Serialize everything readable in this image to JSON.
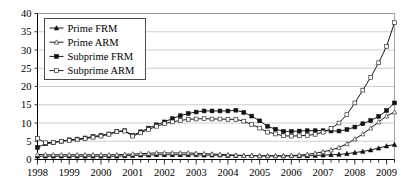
{
  "chart_data": {
    "type": "line",
    "title": "",
    "xlabel": "",
    "ylabel": "",
    "ylim": [
      0,
      40
    ],
    "ytick_step": 5,
    "yticks": [
      0,
      5,
      10,
      15,
      20,
      25,
      30,
      35,
      40
    ],
    "grid": true,
    "legend_position": "top-left",
    "x_axis_type": "quarterly",
    "xlim": [
      "1998 Q1",
      "2009 Q2"
    ],
    "categories": [
      "1998Q1",
      "1998Q2",
      "1998Q3",
      "1998Q4",
      "1999Q1",
      "1999Q2",
      "1999Q3",
      "1999Q4",
      "2000Q1",
      "2000Q2",
      "2000Q3",
      "2000Q4",
      "2001Q1",
      "2001Q2",
      "2001Q3",
      "2001Q4",
      "2002Q1",
      "2002Q2",
      "2002Q3",
      "2002Q4",
      "2003Q1",
      "2003Q2",
      "2003Q3",
      "2003Q4",
      "2004Q1",
      "2004Q2",
      "2004Q3",
      "2004Q4",
      "2005Q1",
      "2005Q2",
      "2005Q3",
      "2005Q4",
      "2006Q1",
      "2006Q2",
      "2006Q3",
      "2006Q4",
      "2007Q1",
      "2007Q2",
      "2007Q3",
      "2007Q4",
      "2008Q1",
      "2008Q2",
      "2008Q3",
      "2008Q4",
      "2009Q1",
      "2009Q2"
    ],
    "xtick_labels": [
      "1998",
      "1999",
      "2000",
      "2001",
      "2002",
      "2003",
      "2004",
      "2005",
      "2006",
      "2007",
      "2008",
      "2009"
    ],
    "series": [
      {
        "name": "Prime FRM",
        "marker": "filled-triangle",
        "values": [
          0.9,
          0.9,
          0.9,
          0.9,
          0.9,
          0.9,
          0.9,
          0.9,
          0.9,
          0.9,
          0.9,
          1.0,
          1.1,
          1.2,
          1.2,
          1.3,
          1.3,
          1.3,
          1.3,
          1.3,
          1.3,
          1.2,
          1.2,
          1.2,
          1.1,
          1.1,
          1.1,
          1.1,
          1.0,
          1.0,
          1.0,
          1.0,
          1.0,
          1.0,
          1.0,
          1.1,
          1.2,
          1.3,
          1.4,
          1.6,
          1.9,
          2.2,
          2.6,
          3.1,
          3.7,
          4.1
        ]
      },
      {
        "name": "Prime ARM",
        "marker": "open-triangle",
        "values": [
          1.4,
          1.3,
          1.3,
          1.3,
          1.3,
          1.3,
          1.3,
          1.3,
          1.3,
          1.3,
          1.3,
          1.4,
          1.5,
          1.6,
          1.7,
          1.8,
          1.8,
          1.8,
          1.8,
          1.8,
          1.7,
          1.6,
          1.5,
          1.4,
          1.3,
          1.2,
          1.1,
          1.1,
          1.0,
          1.0,
          1.0,
          1.0,
          1.1,
          1.2,
          1.4,
          1.7,
          2.1,
          2.6,
          3.3,
          4.3,
          5.6,
          7.0,
          8.6,
          10.3,
          11.9,
          13.0
        ]
      },
      {
        "name": "Subprime FRM",
        "marker": "filled-square",
        "values": [
          3.3,
          4.3,
          4.6,
          5.0,
          5.4,
          5.6,
          5.9,
          6.3,
          6.6,
          7.0,
          7.7,
          7.9,
          6.6,
          7.6,
          8.6,
          9.5,
          10.3,
          11.2,
          12.0,
          12.6,
          13.0,
          13.3,
          13.3,
          13.3,
          13.3,
          13.5,
          12.9,
          11.9,
          10.6,
          9.1,
          8.3,
          7.7,
          7.7,
          7.8,
          7.9,
          7.9,
          7.9,
          7.8,
          7.8,
          8.2,
          8.9,
          9.8,
          10.7,
          11.8,
          13.4,
          15.5
        ]
      },
      {
        "name": "Subprime ARM",
        "marker": "open-square",
        "values": [
          5.8,
          4.6,
          4.7,
          5.0,
          5.2,
          5.4,
          5.7,
          6.1,
          6.4,
          6.9,
          7.6,
          7.8,
          6.4,
          7.3,
          8.2,
          9.1,
          9.8,
          10.3,
          10.7,
          11.0,
          11.1,
          11.2,
          11.1,
          11.1,
          11.0,
          11.0,
          10.5,
          9.6,
          8.6,
          7.5,
          7.0,
          6.5,
          6.4,
          6.5,
          6.6,
          6.9,
          7.5,
          8.5,
          10.0,
          12.3,
          15.5,
          19.0,
          22.5,
          26.5,
          31.0,
          37.5
        ]
      }
    ]
  },
  "legend": {
    "items": [
      {
        "label": "Prime FRM"
      },
      {
        "label": "Prime ARM"
      },
      {
        "label": "Subprime FRM"
      },
      {
        "label": "Subprime ARM"
      }
    ]
  }
}
